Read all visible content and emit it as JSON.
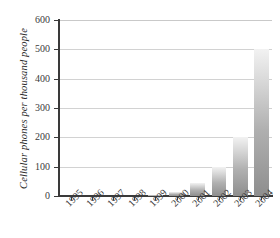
{
  "chart_data": {
    "type": "bar",
    "title": "",
    "subtitle": "",
    "xlabel": "",
    "ylabel": "Cellular phones per thousand people",
    "categories": [
      "1995",
      "1996",
      "1997",
      "1998",
      "1999",
      "2000",
      "2001",
      "2002",
      "2003",
      "2004"
    ],
    "values": [
      0,
      0,
      0,
      1,
      5,
      15,
      45,
      100,
      200,
      500
    ],
    "ylim": [
      0,
      600
    ],
    "yticks": [
      0,
      100,
      200,
      300,
      400,
      500,
      600
    ],
    "ytick_labels": [
      "0",
      "100",
      "200",
      "300",
      "400",
      "500",
      "600"
    ],
    "grid": true,
    "legend": false,
    "legend_position": "none",
    "series": [
      {
        "name": "Cellular phones per thousand people",
        "values": [
          0,
          0,
          0,
          1,
          5,
          15,
          45,
          100,
          200,
          500
        ]
      }
    ],
    "annotations": [],
    "colors": {
      "bar_top": "#f2f2f2",
      "bar_bottom": "#8e8e8e",
      "axis": "#3a3a3a",
      "gridline": "#d2d2d2",
      "text": "#2a2a2a",
      "background": "#ffffff"
    }
  }
}
